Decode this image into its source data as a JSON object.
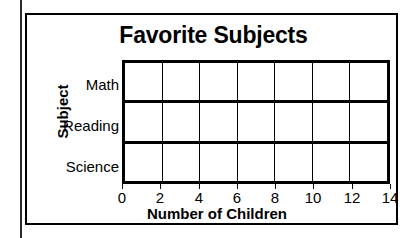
{
  "chart_data": {
    "type": "bar",
    "orientation": "horizontal",
    "title": "Favorite Subjects",
    "xlabel": "Number of Children",
    "ylabel": "Subject",
    "categories": [
      "Math",
      "Reading",
      "Science"
    ],
    "values": [
      null,
      null,
      null
    ],
    "xlim": [
      0,
      14
    ],
    "xticks": [
      "0",
      "2",
      "4",
      "6",
      "8",
      "10",
      "12",
      "14"
    ],
    "xtick_step": 2,
    "grid": true,
    "legend": null,
    "note": "blank worksheet grid - no bars drawn",
    "colors": {
      "axis": "#000000",
      "gridline": "#000000",
      "background": "#ffffff"
    }
  },
  "card": {
    "border_color": "#000000"
  }
}
